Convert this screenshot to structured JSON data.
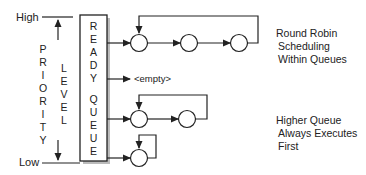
{
  "axis": {
    "high_label": "High",
    "low_label": "Low",
    "priority_letters": [
      "P",
      "R",
      "I",
      "O",
      "R",
      "I",
      "T",
      "Y"
    ],
    "level_letters": [
      "L",
      "E",
      "V",
      "E",
      "L"
    ]
  },
  "ready_box": {
    "letters": [
      "R",
      "E",
      "A",
      "D",
      "Y",
      "",
      "Q",
      "U",
      "E",
      "U",
      "E",
      "S"
    ]
  },
  "queues": [
    {
      "name": "queue-1",
      "processes": 3,
      "empty": false
    },
    {
      "name": "queue-2",
      "processes": 0,
      "empty": true,
      "empty_label": "<empty>"
    },
    {
      "name": "queue-3",
      "processes": 2,
      "empty": false
    },
    {
      "name": "queue-4",
      "processes": 1,
      "empty": false
    }
  ],
  "annotations": {
    "round_robin": [
      "Round Robin",
      "Scheduling",
      "Within Queues"
    ],
    "higher_queue": [
      "Higher Queue",
      "Always Executes",
      "First"
    ]
  },
  "colors": {
    "line": "#222222",
    "shadow": "#bbbbbb"
  }
}
